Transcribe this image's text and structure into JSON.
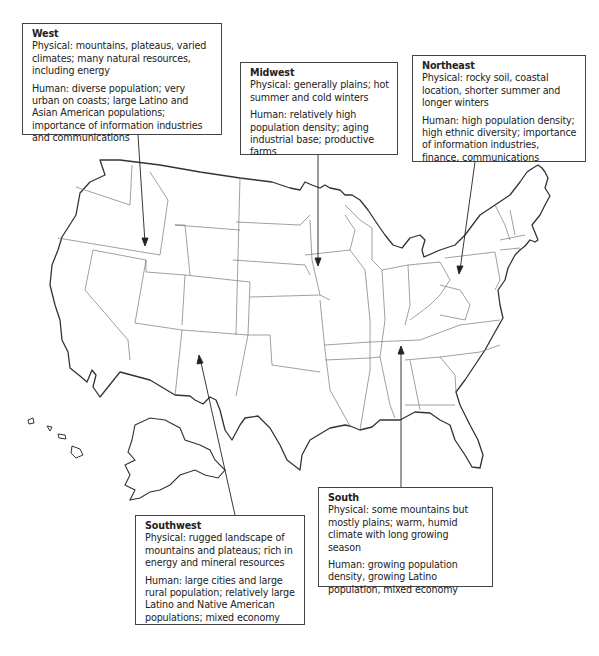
{
  "figure": {
    "regions": [
      {
        "id": "west",
        "name": "West",
        "physical": "Physical: mountains, plateaus, varied climates; many natural resources, including energy",
        "human": "Human: diverse population; very urban on coasts; large Latino and Asian American populations; importance of information industries and communications"
      },
      {
        "id": "midwest",
        "name": "Midwest",
        "physical": "Physical: generally plains; hot summer and cold winters",
        "human": "Human: relatively high population density; aging industrial base; productive farms"
      },
      {
        "id": "northeast",
        "name": "Northeast",
        "physical": "Physical: rocky soil, coastal location, shorter summer and longer winters",
        "human": "Human: high population density; high ethnic diversity; importance of information industries, finance, communications"
      },
      {
        "id": "southwest",
        "name": "Southwest",
        "physical": "Physical: rugged landscape of mountains and plateaus; rich in energy and mineral resources",
        "human": "Human: large cities and large rural population; relatively large Latino and Native American populations; mixed economy"
      },
      {
        "id": "south",
        "name": "South",
        "physical": "Physical: some mountains but mostly plains; warm, humid climate with long growing season",
        "human": "Human: growing population density, growing Latino population, mixed economy"
      }
    ],
    "colors": {
      "outline": "#333333",
      "state_border": "#777777",
      "arrow": "#222222"
    }
  }
}
